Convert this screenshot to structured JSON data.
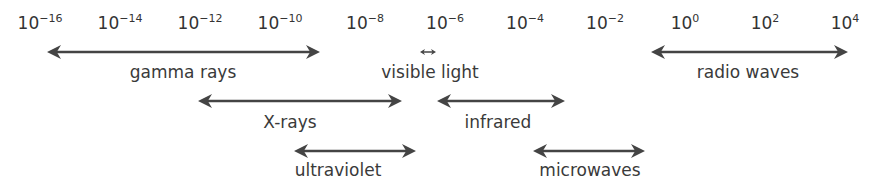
{
  "diagram": {
    "ticks": [
      {
        "base": "10",
        "exp": "−16",
        "x": 40
      },
      {
        "base": "10",
        "exp": "−14",
        "x": 120
      },
      {
        "base": "10",
        "exp": "−12",
        "x": 200
      },
      {
        "base": "10",
        "exp": "−10",
        "x": 280
      },
      {
        "base": "10",
        "exp": "−8",
        "x": 365
      },
      {
        "base": "10",
        "exp": "−6",
        "x": 445
      },
      {
        "base": "10",
        "exp": "−4",
        "x": 525
      },
      {
        "base": "10",
        "exp": "−2",
        "x": 605
      },
      {
        "base": "10",
        "exp": "0",
        "x": 685
      },
      {
        "base": "10",
        "exp": "2",
        "x": 765
      },
      {
        "base": "10",
        "exp": "4",
        "x": 845
      }
    ],
    "bands": [
      {
        "name": "gamma rays",
        "x1": 47,
        "x2": 320,
        "y": 52,
        "lx": 183,
        "ly": 62
      },
      {
        "name": "visible light",
        "x1": 420,
        "x2": 436,
        "y": 52,
        "lx": 430,
        "ly": 62
      },
      {
        "name": "radio waves",
        "x1": 651,
        "x2": 848,
        "y": 52,
        "lx": 748,
        "ly": 62
      },
      {
        "name": "X-rays",
        "x1": 198,
        "x2": 402,
        "y": 101,
        "lx": 290,
        "ly": 112
      },
      {
        "name": "infrared",
        "x1": 437,
        "x2": 565,
        "y": 101,
        "lx": 498,
        "ly": 112
      },
      {
        "name": "ultraviolet",
        "x1": 294,
        "x2": 416,
        "y": 151,
        "lx": 338,
        "ly": 160
      },
      {
        "name": "microwaves",
        "x1": 533,
        "x2": 645,
        "y": 151,
        "lx": 590,
        "ly": 160
      }
    ]
  }
}
